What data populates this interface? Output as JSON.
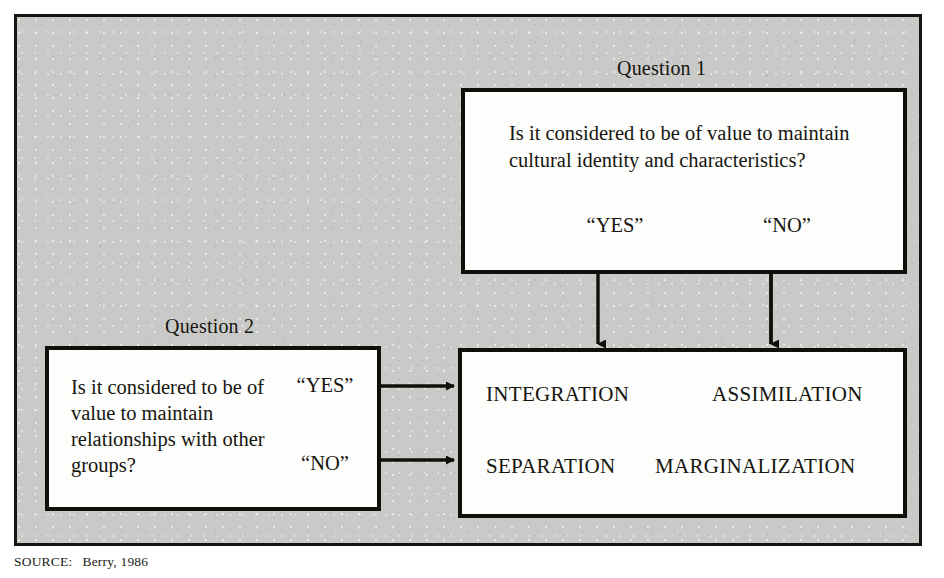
{
  "figure": {
    "background_color": "#c9c9c7",
    "border_color": "#100f0b",
    "box_fill_color": "#fdfdfc",
    "text_color": "#16150f"
  },
  "question1": {
    "caption": "Question 1",
    "prompt": "Is it considered to be of value to maintain cultural identity and characteristics?",
    "answer_yes": "“YES”",
    "answer_no": "“NO”"
  },
  "question2": {
    "caption": "Question 2",
    "prompt": "Is it considered to be of value to maintain relationships with other groups?",
    "answer_yes": "“YES”",
    "answer_no": "“NO”"
  },
  "outcomes": {
    "integration": "INTEGRATION",
    "assimilation": "ASSIMILATION",
    "separation": "SEPARATION",
    "marginalization": "MARGINALIZATION"
  },
  "source": {
    "label": "SOURCE:",
    "text": "Berry, 1986"
  }
}
